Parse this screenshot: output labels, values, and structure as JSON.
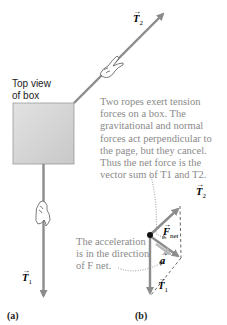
{
  "figure": {
    "box_label": [
      "Top view",
      "of box"
    ],
    "panel_a_label": "(a)",
    "panel_b_label": "(b)",
    "note_top": [
      "Two ropes exert tension",
      "forces on a box. The",
      "gravitational and normal",
      "forces act perpendicular to",
      "the page, but they cancel.",
      "Thus the net force is the",
      "vector sum of T1 and T2."
    ],
    "note_bottom": [
      "The acceleration",
      "is in the direction",
      "of F net."
    ],
    "vectors": {
      "T1": {
        "symbol": "T",
        "subscript": "1"
      },
      "T2": {
        "symbol": "T",
        "subscript": "2"
      },
      "Fnet": {
        "symbol": "F",
        "subscript": "net"
      },
      "a": {
        "symbol": "a",
        "subscript": ""
      }
    },
    "colors": {
      "arrow_gray": "#8c8c8c",
      "acceleration_arrow": "#b8b8b8",
      "note_text": "#8a8a8a",
      "box_fill": "#d4d4d4",
      "dashed": "#555555"
    }
  }
}
